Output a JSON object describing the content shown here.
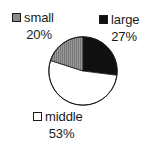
{
  "chart_data": {
    "type": "pie",
    "title": "",
    "categories": [
      "large",
      "middle",
      "small"
    ],
    "values": [
      27,
      53,
      20
    ],
    "unit": "%",
    "legend_position": "around-slices",
    "grid": false,
    "slices": [
      {
        "label": "large",
        "percent_text": "27%",
        "value": 27,
        "color": "#101010",
        "swatch": "fill-black",
        "start_deg": 0,
        "end_deg": 97.2
      },
      {
        "label": "middle",
        "percent_text": "53%",
        "value": 53,
        "color": "#ffffff",
        "swatch": "fill-white",
        "start_deg": 97.2,
        "end_deg": 288.0
      },
      {
        "label": "small",
        "percent_text": "20%",
        "value": 20,
        "color": "#8a8a8a",
        "swatch": "fill-gray",
        "start_deg": 288.0,
        "end_deg": 360.0
      }
    ]
  },
  "legend": {
    "small": {
      "label": "small",
      "percent": "20%",
      "marker": "gray-square-marker"
    },
    "large": {
      "label": "large",
      "percent": "27%",
      "marker": "black-square-marker"
    },
    "middle": {
      "label": "middle",
      "percent": "53%",
      "marker": "white-square-marker"
    }
  },
  "colors": {
    "large": "#101010",
    "middle": "#ffffff",
    "small": "#8a8a8a",
    "outline": "#1a1a1a",
    "background": "#ffffff"
  }
}
